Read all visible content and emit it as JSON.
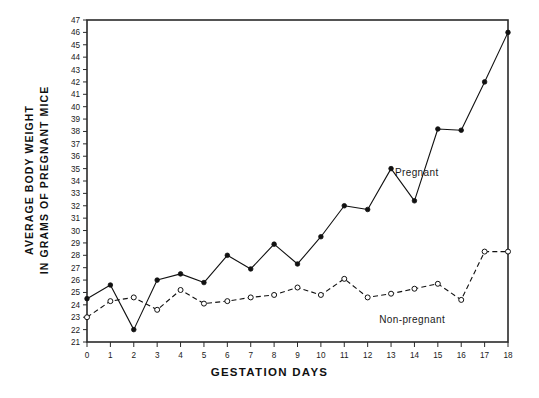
{
  "chart_data": {
    "type": "line",
    "title": "",
    "xlabel": "GESTATION DAYS",
    "ylabel": "AVERAGE BODY WEIGHT\nIN GRAMS OF PREGNANT MICE",
    "ylabel_line1": "AVERAGE BODY WEIGHT",
    "ylabel_line2": "IN GRAMS OF PREGNANT MICE",
    "xlim": [
      0,
      18
    ],
    "ylim": [
      21,
      47
    ],
    "xticks": [
      0,
      1,
      2,
      3,
      4,
      5,
      6,
      7,
      8,
      9,
      10,
      11,
      12,
      13,
      14,
      15,
      16,
      17,
      18
    ],
    "yticks": [
      21,
      22,
      23,
      24,
      25,
      26,
      27,
      28,
      29,
      30,
      31,
      32,
      33,
      34,
      35,
      36,
      37,
      38,
      39,
      40,
      41,
      42,
      43,
      44,
      45,
      46,
      47
    ],
    "grid": false,
    "legend_position": "inline-annotations",
    "x": [
      0,
      1,
      2,
      3,
      4,
      5,
      6,
      7,
      8,
      9,
      10,
      11,
      12,
      13,
      14,
      15,
      16,
      17,
      18
    ],
    "series": [
      {
        "name": "Pregnant",
        "label": "Pregnant",
        "line_style": "solid",
        "marker": "filled-circle",
        "color": "#111111",
        "label_x": 14.1,
        "label_y": 34.4,
        "values": [
          24.5,
          25.6,
          22.0,
          26.0,
          26.5,
          25.8,
          28.0,
          26.9,
          28.9,
          27.3,
          29.5,
          32.0,
          31.7,
          35.0,
          32.4,
          38.2,
          38.1,
          42.0,
          46.0
        ]
      },
      {
        "name": "Non-pregnant",
        "label": "Non-pregnant",
        "line_style": "dashed",
        "marker": "open-circle",
        "color": "#111111",
        "label_x": 13.9,
        "label_y": 22.5,
        "values": [
          23.0,
          24.3,
          24.6,
          23.6,
          25.2,
          24.1,
          24.3,
          24.6,
          24.8,
          25.4,
          24.8,
          26.1,
          24.6,
          24.9,
          25.3,
          25.7,
          24.4,
          28.3,
          28.3
        ]
      }
    ]
  },
  "axis": {
    "x_tick_labels": [
      "0",
      "1",
      "2",
      "3",
      "4",
      "5",
      "6",
      "7",
      "8",
      "9",
      "10",
      "11",
      "12",
      "13",
      "14",
      "15",
      "16",
      "17",
      "18"
    ],
    "y_tick_labels": [
      "21",
      "22",
      "23",
      "24",
      "25",
      "26",
      "27",
      "28",
      "29",
      "30",
      "31",
      "32",
      "33",
      "34",
      "35",
      "36",
      "37",
      "38",
      "39",
      "40",
      "41",
      "42",
      "43",
      "44",
      "45",
      "46",
      "47"
    ]
  }
}
